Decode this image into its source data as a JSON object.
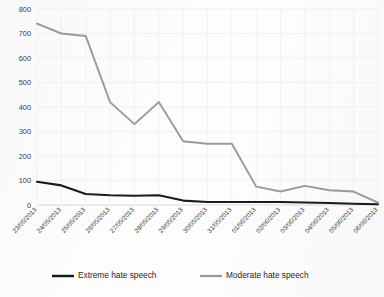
{
  "chart_data": {
    "type": "line",
    "title": "",
    "xlabel": "",
    "ylabel": "",
    "ylim": [
      0,
      800
    ],
    "ytick_step": 100,
    "grid": true,
    "legend_position": "bottom",
    "categories": [
      "23/05/2013",
      "24/05/2013",
      "25/05/2013",
      "26/05/2013",
      "27/05/2013",
      "28/05/2013",
      "29/05/2013",
      "30/05/2013",
      "31/05/2013",
      "01/06/2013",
      "02/06/2013",
      "03/06/2013",
      "04/06/2013",
      "05/06/2013",
      "06/06/2013"
    ],
    "yticks": [
      0,
      100,
      200,
      300,
      400,
      500,
      600,
      700,
      800
    ],
    "ytick_labels": [
      "0",
      "100",
      "200",
      "300",
      "400",
      "500",
      "600",
      "700",
      "800"
    ],
    "series": [
      {
        "name": "Extreme hate speech",
        "color": "#1a1a1a",
        "width": 2.1,
        "values": [
          95,
          80,
          45,
          40,
          38,
          40,
          18,
          12,
          12,
          12,
          12,
          10,
          8,
          5,
          3
        ]
      },
      {
        "name": "Moderate hate speech",
        "color": "#9a9a9a",
        "width": 1.9,
        "values": [
          740,
          700,
          690,
          420,
          330,
          420,
          260,
          250,
          250,
          75,
          55,
          78,
          60,
          55,
          10
        ]
      }
    ]
  },
  "legend": {
    "items": [
      {
        "label": "Extreme hate speech",
        "color": "#1a1a1a"
      },
      {
        "label": "Moderate hate speech",
        "color": "#9a9a9a"
      }
    ]
  }
}
